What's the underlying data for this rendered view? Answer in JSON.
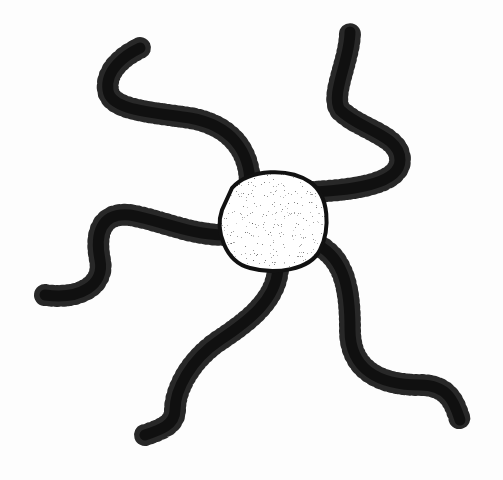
{
  "image": {
    "subject": "Brittle star illustration",
    "style": "black ink drawing on white",
    "background": "#fdfdfd",
    "ink": "#111111",
    "disc_fill": "#bdbdbd",
    "arm_count": 5
  }
}
